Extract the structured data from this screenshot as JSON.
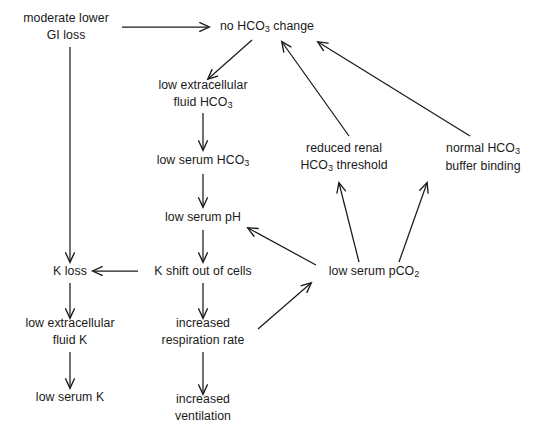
{
  "diagram": {
    "background_color": "#ffffff",
    "stroke_color": "#1a1a1a",
    "nodes": [
      {
        "id": "gi_loss",
        "lines": [
          "moderate lower",
          "GI loss"
        ],
        "x": 66,
        "y": 27
      },
      {
        "id": "no_hco3_change",
        "lines": [
          "no HCO",
          "3",
          " change"
        ],
        "text": "no HCO3 change",
        "x": 267,
        "y": 27
      },
      {
        "id": "low_ec_hco3",
        "lines": [
          "low extracellular",
          "fluid HCO3"
        ],
        "x": 203,
        "y": 95
      },
      {
        "id": "low_serum_hco3",
        "lines": [
          "low serum HCO3"
        ],
        "x": 203,
        "y": 161
      },
      {
        "id": "low_serum_ph",
        "lines": [
          "low serum pH"
        ],
        "x": 203,
        "y": 218
      },
      {
        "id": "reduced_renal",
        "lines": [
          "reduced renal",
          "HCO3 threshold"
        ],
        "x": 344,
        "y": 158
      },
      {
        "id": "normal_buffer",
        "lines": [
          "normal HCO3",
          "buffer binding"
        ],
        "x": 483,
        "y": 158
      },
      {
        "id": "k_loss",
        "lines": [
          "K loss"
        ],
        "x": 70,
        "y": 272
      },
      {
        "id": "k_shift",
        "lines": [
          "K shift out of cells"
        ],
        "x": 203,
        "y": 272
      },
      {
        "id": "low_pco2",
        "lines": [
          "low serum pCO2"
        ],
        "x": 374,
        "y": 272
      },
      {
        "id": "low_ec_k",
        "lines": [
          "low extracellular",
          "fluid K"
        ],
        "x": 70,
        "y": 332
      },
      {
        "id": "incr_resp",
        "lines": [
          "increased",
          "respiration rate"
        ],
        "x": 203,
        "y": 332
      },
      {
        "id": "low_serum_k",
        "lines": [
          "low serum K"
        ],
        "x": 70,
        "y": 398
      },
      {
        "id": "incr_vent",
        "lines": [
          "increased",
          "ventilation"
        ],
        "x": 203,
        "y": 408
      }
    ],
    "node_labels": {
      "gi_loss_l1": "moderate lower",
      "gi_loss_l2": "GI loss",
      "no_hco3_pre": "no HCO",
      "no_hco3_sub": "3",
      "no_hco3_post": " change",
      "low_ec_hco3_l1": "low extracellular",
      "low_ec_hco3_l2_pre": "fluid HCO",
      "low_ec_hco3_l2_sub": "3",
      "low_serum_hco3_pre": "low serum HCO",
      "low_serum_hco3_sub": "3",
      "low_serum_ph": "low serum pH",
      "reduced_renal_l1": "reduced renal",
      "reduced_renal_l2_pre": "HCO",
      "reduced_renal_l2_sub": "3",
      "reduced_renal_l2_post": " threshold",
      "normal_buffer_l1_pre": "normal HCO",
      "normal_buffer_l1_sub": "3",
      "normal_buffer_l2": "buffer binding",
      "k_loss": "K loss",
      "k_shift": "K shift out of cells",
      "low_pco2_pre": "low serum pCO",
      "low_pco2_sub": "2",
      "low_ec_k_l1": "low extracellular",
      "low_ec_k_l2": "fluid K",
      "incr_resp_l1": "increased",
      "incr_resp_l2": "respiration rate",
      "low_serum_k": "low serum K",
      "incr_vent_l1": "increased",
      "incr_vent_l2": "ventilation"
    },
    "edges": [
      {
        "id": "gi-to-nochange",
        "from": "gi_loss",
        "to": "no_hco3_change",
        "style": "horizontal-right"
      },
      {
        "id": "gi-to-kloss",
        "from": "gi_loss",
        "to": "k_loss",
        "style": "vertical-down"
      },
      {
        "id": "nochange-to-lowec",
        "from": "no_hco3_change",
        "to": "low_ec_hco3",
        "style": "diagonal-down-left"
      },
      {
        "id": "lowec-to-serumhco3",
        "from": "low_ec_hco3",
        "to": "low_serum_hco3",
        "style": "vertical-down"
      },
      {
        "id": "serumhco3-to-ph",
        "from": "low_serum_hco3",
        "to": "low_serum_ph",
        "style": "vertical-down"
      },
      {
        "id": "ph-to-kshift",
        "from": "low_serum_ph",
        "to": "k_shift",
        "style": "vertical-down"
      },
      {
        "id": "kshift-to-kloss",
        "from": "k_shift",
        "to": "k_loss",
        "style": "horizontal-left"
      },
      {
        "id": "kloss-to-lowek",
        "from": "k_loss",
        "to": "low_ec_k",
        "style": "vertical-down"
      },
      {
        "id": "lowek-to-serumk",
        "from": "low_ec_k",
        "to": "low_serum_k",
        "style": "vertical-down"
      },
      {
        "id": "kshift-to-resp",
        "from": "k_shift",
        "to": "incr_resp",
        "style": "vertical-down"
      },
      {
        "id": "resp-to-vent",
        "from": "incr_resp",
        "to": "incr_vent",
        "style": "vertical-down"
      },
      {
        "id": "resp-to-pco2",
        "from": "incr_resp",
        "to": "low_pco2",
        "style": "diagonal-up-right"
      },
      {
        "id": "pco2-to-ph",
        "from": "low_pco2",
        "to": "low_serum_ph",
        "style": "diagonal-up-left"
      },
      {
        "id": "pco2-to-renal",
        "from": "low_pco2",
        "to": "reduced_renal",
        "style": "diagonal-up-left"
      },
      {
        "id": "pco2-to-buffer",
        "from": "low_pco2",
        "to": "normal_buffer",
        "style": "diagonal-up-right"
      },
      {
        "id": "renal-to-nochange",
        "from": "reduced_renal",
        "to": "no_hco3_change",
        "style": "diagonal-up-left"
      },
      {
        "id": "buffer-to-nochange",
        "from": "normal_buffer",
        "to": "no_hco3_change",
        "style": "diagonal-up-left"
      }
    ]
  }
}
